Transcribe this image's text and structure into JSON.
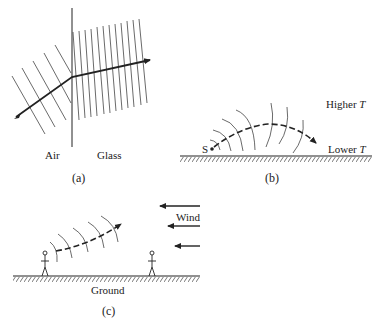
{
  "figure": {
    "panels": [
      {
        "id": "a",
        "caption": "(a)",
        "labels": {
          "left_medium": "Air",
          "right_medium": "Glass"
        }
      },
      {
        "id": "b",
        "caption": "(b)",
        "labels": {
          "upper": "Higher",
          "lower": "Lower",
          "variable": "T",
          "source": "S"
        }
      },
      {
        "id": "c",
        "caption": "(c)",
        "labels": {
          "wind": "Wind",
          "ground": "Ground"
        }
      }
    ]
  },
  "colors": {
    "ink": "#222222",
    "background": "#ffffff"
  }
}
